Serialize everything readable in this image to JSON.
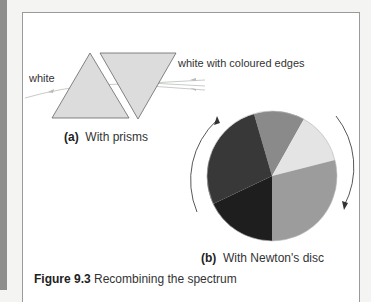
{
  "figure": {
    "number_label": "Figure 9.3",
    "title": "Recombining the spectrum"
  },
  "panel_a": {
    "tag": "(a)",
    "caption": "With prisms",
    "input_label": "white",
    "output_label": "white with coloured edges"
  },
  "panel_b": {
    "tag": "(b)",
    "caption": "With Newton's disc"
  },
  "colors": {
    "prism_fill": "#dcdcdc",
    "ray": "#c8ccc8",
    "disc_segments": [
      "#8a8a8a",
      "#e4e4e4",
      "#9c9c9c",
      "#222222",
      "#3a3a3a"
    ]
  }
}
